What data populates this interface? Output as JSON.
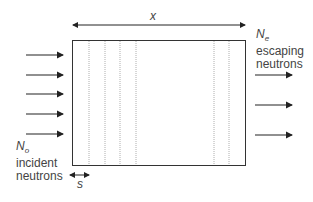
{
  "diagram": {
    "length_label": "x",
    "step_label": "s",
    "incident": {
      "symbol": "N",
      "subscript": "o",
      "line1": "incident",
      "line2": "neutrons"
    },
    "escaping": {
      "symbol": "N",
      "subscript": "e",
      "line1": "escaping",
      "line2": "neutrons"
    },
    "incident_arrow_count": 5,
    "escaping_arrow_count": 3,
    "slab_divider_count": 6,
    "colors": {
      "line": "#222222",
      "divider": "#999999"
    }
  }
}
